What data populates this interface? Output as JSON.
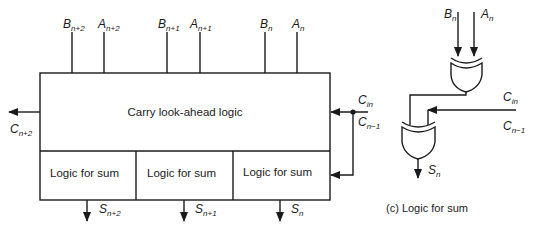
{
  "diagram": {
    "main_block": {
      "label": "Carry look-ahead logic",
      "sum_blocks": [
        "Logic for sum",
        "Logic for sum",
        "Logic for sum"
      ]
    },
    "inputs": [
      {
        "sym": "B",
        "sub": "n+2"
      },
      {
        "sym": "A",
        "sub": "n+2"
      },
      {
        "sym": "B",
        "sub": "n+1"
      },
      {
        "sym": "A",
        "sub": "n+1"
      },
      {
        "sym": "B",
        "sub": "n"
      },
      {
        "sym": "A",
        "sub": "n"
      }
    ],
    "carry_out": {
      "sym": "C",
      "sub": "n+2"
    },
    "carry_in": {
      "sym": "C",
      "sub": "in"
    },
    "carry_prev": {
      "sym": "C",
      "sub": "n−1"
    },
    "outputs": [
      {
        "sym": "S",
        "sub": "n+2"
      },
      {
        "sym": "S",
        "sub": "n+1"
      },
      {
        "sym": "S",
        "sub": "n"
      }
    ],
    "detail": {
      "inputs": [
        {
          "sym": "B",
          "sub": "n"
        },
        {
          "sym": "A",
          "sub": "n"
        }
      ],
      "carry_in": {
        "sym": "C",
        "sub": "in"
      },
      "carry_prev": {
        "sym": "C",
        "sub": "n−1"
      },
      "output": {
        "sym": "S",
        "sub": "n"
      },
      "caption": "(c) Logic for sum"
    }
  }
}
